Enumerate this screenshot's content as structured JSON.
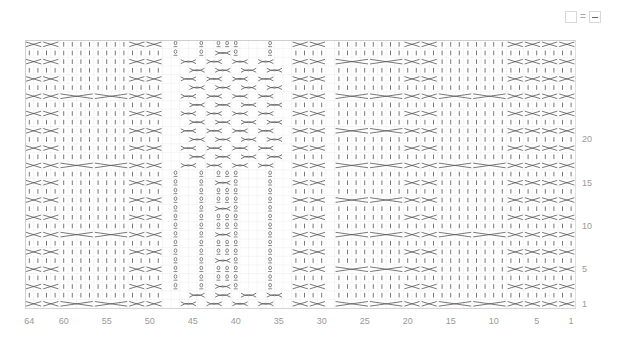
{
  "legend": {
    "items": [
      {
        "symbol": "knit",
        "name": "empty-square-icon"
      },
      {
        "symbol": "equals",
        "text": "="
      },
      {
        "symbol": "purl",
        "name": "purl-dash-icon"
      }
    ]
  },
  "chart": {
    "columns": 64,
    "rows": 31,
    "cell_w": 8.6,
    "cell_h": 8.65,
    "grid_color": "#ececec",
    "border_color": "#cfcfcf",
    "stitch_color": "#555555",
    "column_labels": [
      {
        "text": "64",
        "col": 64
      },
      {
        "text": "60",
        "col": 60
      },
      {
        "text": "55",
        "col": 55
      },
      {
        "text": "50",
        "col": 50
      },
      {
        "text": "45",
        "col": 45
      },
      {
        "text": "40",
        "col": 40
      },
      {
        "text": "35",
        "col": 35
      },
      {
        "text": "30",
        "col": 30
      },
      {
        "text": "25",
        "col": 25
      },
      {
        "text": "20",
        "col": 20
      },
      {
        "text": "15",
        "col": 15
      },
      {
        "text": "10",
        "col": 10
      },
      {
        "text": "5",
        "col": 5
      },
      {
        "text": "1",
        "col": 1
      }
    ],
    "row_labels": [
      {
        "text": "20",
        "row": 20
      },
      {
        "text": "15",
        "row": 15
      },
      {
        "text": "10",
        "row": 10
      },
      {
        "text": "5",
        "row": 5
      },
      {
        "text": "1",
        "row": 1
      }
    ],
    "panels": [
      {
        "type": "mini-cable",
        "cols": [
          61,
          64
        ]
      },
      {
        "type": "wide-cable",
        "cols": [
          53,
          60
        ]
      },
      {
        "type": "mini-cable",
        "cols": [
          49,
          52
        ]
      },
      {
        "type": "twisted-center",
        "cols": [
          34,
          48
        ]
      },
      {
        "type": "mini-cable",
        "cols": [
          30,
          33
        ]
      },
      {
        "type": "wide-cable",
        "cols": [
          22,
          29
        ]
      },
      {
        "type": "mini-cable",
        "cols": [
          18,
          21
        ]
      },
      {
        "type": "wide-cable-alt",
        "cols": [
          9,
          16
        ]
      },
      {
        "type": "mini-cable",
        "cols": [
          1,
          4
        ]
      },
      {
        "type": "mini-cable",
        "cols": [
          5,
          8
        ],
        "note": "purl-rib"
      }
    ]
  }
}
